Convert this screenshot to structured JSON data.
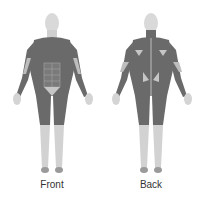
{
  "figures": [
    {
      "id": "front",
      "label": "Front"
    },
    {
      "id": "back",
      "label": "Back"
    }
  ],
  "colors": {
    "skin": "#d6d6d6",
    "muscle": "#6a6a6a",
    "highlight": "#bdbdbd",
    "label": "#333333"
  }
}
